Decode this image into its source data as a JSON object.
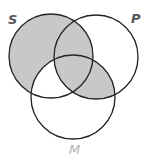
{
  "diagram": {
    "type": "venn-3",
    "labels": {
      "S": "S",
      "P": "P",
      "M": "M"
    },
    "circles": [
      {
        "name": "S",
        "cx": 51,
        "cy": 56,
        "r": 42
      },
      {
        "name": "P",
        "cx": 96,
        "cy": 57,
        "r": 42
      },
      {
        "name": "M",
        "cx": 73,
        "cy": 97,
        "r": 42
      }
    ],
    "shaded_regions": [
      "S only",
      "S∩P only",
      "S∩P∩M",
      "P∩M only"
    ],
    "unshaded_regions": [
      "P only",
      "M only",
      "S∩M only"
    ],
    "colors": {
      "shade": "#c8c8c8",
      "stroke": "#222222",
      "background": "#ffffff"
    }
  }
}
